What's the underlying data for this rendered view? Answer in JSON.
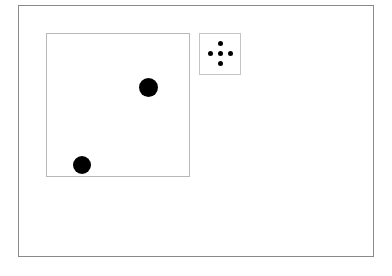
{
  "scene": {
    "frame": {
      "border_color": "#8a8a8a"
    },
    "canvas": {
      "border_color": "#b8b8b8",
      "dots": [
        {
          "cx": 148,
          "cy": 87,
          "diameter": 19,
          "color": "#000000"
        },
        {
          "cx": 81,
          "cy": 165,
          "diameter": 18,
          "color": "#000000"
        }
      ]
    },
    "control_pad": {
      "icon": "move-crosshair-icon",
      "border_color": "#c4c4c4",
      "pips": [
        "up",
        "left",
        "center",
        "right",
        "down"
      ]
    }
  }
}
